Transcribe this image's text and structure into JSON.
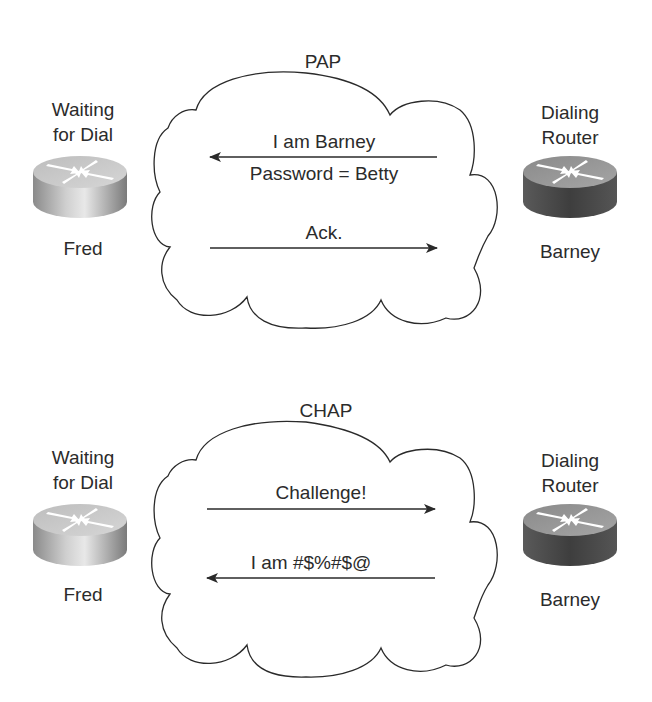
{
  "diagram": {
    "colors": {
      "line": "#2a2a2a",
      "router_light_top": "#c9c9c9",
      "router_light_side": "#9a9a9a",
      "router_dark_top": "#8e8e8e",
      "router_dark_side": "#4a4a4a"
    },
    "pap": {
      "title": "PAP",
      "left_node": {
        "role_line1": "Waiting",
        "role_line2": "for Dial",
        "name": "Fred",
        "icon": "router-icon"
      },
      "right_node": {
        "role_line1": "Dialing",
        "role_line2": "Router",
        "name": "Barney",
        "icon": "router-icon"
      },
      "messages": [
        {
          "text": "I am Barney",
          "direction": "right-to-left"
        },
        {
          "text": "Password = Betty",
          "direction": "none"
        },
        {
          "text": "Ack.",
          "direction": "left-to-right"
        }
      ]
    },
    "chap": {
      "title": "CHAP",
      "left_node": {
        "role_line1": "Waiting",
        "role_line2": "for Dial",
        "name": "Fred",
        "icon": "router-icon"
      },
      "right_node": {
        "role_line1": "Dialing",
        "role_line2": "Router",
        "name": "Barney",
        "icon": "router-icon"
      },
      "messages": [
        {
          "text": "Challenge!",
          "direction": "left-to-right"
        },
        {
          "text": "I am #$%#$@",
          "direction": "right-to-left"
        }
      ]
    }
  }
}
